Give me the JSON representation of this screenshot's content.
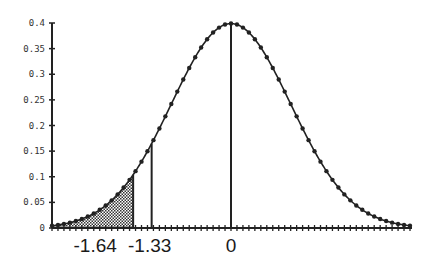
{
  "chart_data": {
    "type": "line",
    "title": "",
    "xlabel": "",
    "ylabel": "",
    "xlim": [
      -3,
      3
    ],
    "ylim": [
      0,
      0.4
    ],
    "grid": false,
    "legend": null,
    "y_ticks": [
      0,
      0.05,
      0.1,
      0.15,
      0.2,
      0.25,
      0.3,
      0.35,
      0.4
    ],
    "y_tick_labels": [
      "0",
      "0.05",
      "0.1",
      "0.15",
      "0.2",
      "0.25",
      "0.3",
      "0.35",
      "0.4"
    ],
    "x_minor_tick_step": 0.1,
    "x_labels": [
      {
        "value": -1.64,
        "label": "-1.64"
      },
      {
        "value": -1.33,
        "label": "-1.33"
      },
      {
        "value": 0,
        "label": "0"
      }
    ],
    "vertical_lines": [
      {
        "x": -1.33,
        "y": 0.1647
      },
      {
        "x": 0,
        "y": 0.3989
      }
    ],
    "shaded_region": {
      "from": -3,
      "to": -1.64,
      "pattern": "crosshatch",
      "edge_y": 0.104
    },
    "series": [
      {
        "name": "normal-pdf",
        "marker_step": 0.1,
        "x": [
          -3.0,
          -2.9,
          -2.8,
          -2.7,
          -2.6,
          -2.5,
          -2.4,
          -2.3,
          -2.2,
          -2.1,
          -2.0,
          -1.9,
          -1.8,
          -1.7,
          -1.6,
          -1.5,
          -1.4,
          -1.3,
          -1.2,
          -1.1,
          -1.0,
          -0.9,
          -0.8,
          -0.7,
          -0.6,
          -0.5,
          -0.4,
          -0.3,
          -0.2,
          -0.1,
          0.0,
          0.1,
          0.2,
          0.3,
          0.4,
          0.5,
          0.6,
          0.7,
          0.8,
          0.9,
          1.0,
          1.1,
          1.2,
          1.3,
          1.4,
          1.5,
          1.6,
          1.7,
          1.8,
          1.9,
          2.0,
          2.1,
          2.2,
          2.3,
          2.4,
          2.5,
          2.6,
          2.7,
          2.8,
          2.9,
          3.0
        ],
        "y": [
          0.0044,
          0.006,
          0.0079,
          0.0104,
          0.0136,
          0.0175,
          0.0224,
          0.0283,
          0.0355,
          0.044,
          0.054,
          0.0656,
          0.079,
          0.094,
          0.1109,
          0.1295,
          0.1497,
          0.1714,
          0.1942,
          0.2179,
          0.242,
          0.2661,
          0.2897,
          0.3123,
          0.3332,
          0.3521,
          0.3683,
          0.3814,
          0.391,
          0.397,
          0.3989,
          0.397,
          0.391,
          0.3814,
          0.3683,
          0.3521,
          0.3332,
          0.3123,
          0.2897,
          0.2661,
          0.242,
          0.2179,
          0.1942,
          0.1714,
          0.1497,
          0.1295,
          0.1109,
          0.094,
          0.079,
          0.0656,
          0.054,
          0.044,
          0.0355,
          0.0283,
          0.0224,
          0.0175,
          0.0136,
          0.0104,
          0.0079,
          0.006,
          0.0044
        ]
      }
    ]
  },
  "style": {
    "line_color": "#222222",
    "axis_color": "#222222",
    "label_color": "#1a1a1a"
  }
}
